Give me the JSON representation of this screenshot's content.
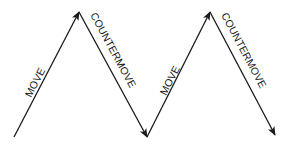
{
  "diagram": {
    "type": "zigzag-arrows",
    "segments": [
      {
        "label": "MOVE",
        "direction": "up"
      },
      {
        "label": "COUNTERMOVE",
        "direction": "down"
      },
      {
        "label": "MOVE",
        "direction": "up"
      },
      {
        "label": "COUNTERMOVE",
        "direction": "down"
      }
    ],
    "colors": {
      "stroke": "#1a1a1a",
      "background": "#ffffff"
    }
  }
}
